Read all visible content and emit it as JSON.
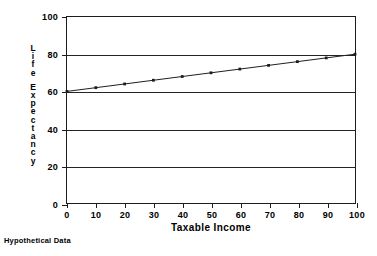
{
  "chart_data": {
    "type": "line",
    "title": "",
    "subtitle": "",
    "xlabel": "Taxable Income",
    "ylabel": "Life Expectancy",
    "caption": "Hypothetical Data",
    "xlim": [
      0,
      100
    ],
    "ylim": [
      0,
      100
    ],
    "xticks": [
      0,
      10,
      20,
      30,
      40,
      50,
      60,
      70,
      80,
      90,
      100
    ],
    "yticks": [
      0,
      20,
      40,
      60,
      80,
      100
    ],
    "gridlines_y": [
      20,
      40,
      60,
      80
    ],
    "grid": "horizontal",
    "legend": "none",
    "marker": "small-square",
    "line_color": "#1c1c1c",
    "frame_color": "#1c1c1c",
    "background": "#ffffff",
    "x": [
      0,
      10,
      20,
      30,
      40,
      50,
      60,
      70,
      80,
      90,
      100
    ],
    "series": [
      {
        "name": "Life Expectancy",
        "values": [
          60,
          62,
          64,
          66,
          68,
          70,
          72,
          74,
          76,
          78,
          80
        ]
      }
    ]
  },
  "axis_titles": {
    "x": "Taxable Income",
    "y_words": [
      "Life",
      "Expectancy"
    ]
  },
  "caption": {
    "text": "Hypothetical Data"
  }
}
